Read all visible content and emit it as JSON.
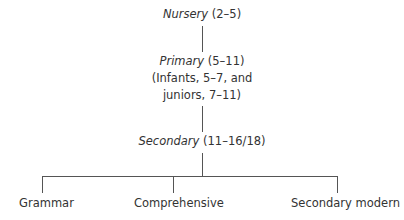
{
  "diagram": {
    "title": "",
    "nodes": {
      "nursery": {
        "name": "Nursery",
        "ages": " (2–5)"
      },
      "primary": {
        "name": "Primary",
        "ages": " (5–11)",
        "note_line1": "(Infants, 5–7, and",
        "note_line2": "juniors, 7–11)"
      },
      "secondary": {
        "name": "Secondary",
        "ages": " (11–16/18)"
      },
      "grammar": {
        "name": "Grammar"
      },
      "comprehensive": {
        "name": "Comprehensive"
      },
      "secondary_modern": {
        "name": "Secondary modern"
      }
    },
    "edges": [
      [
        "nursery",
        "primary"
      ],
      [
        "primary",
        "secondary"
      ],
      [
        "secondary",
        "grammar"
      ],
      [
        "secondary",
        "comprehensive"
      ],
      [
        "secondary",
        "secondary_modern"
      ]
    ]
  }
}
